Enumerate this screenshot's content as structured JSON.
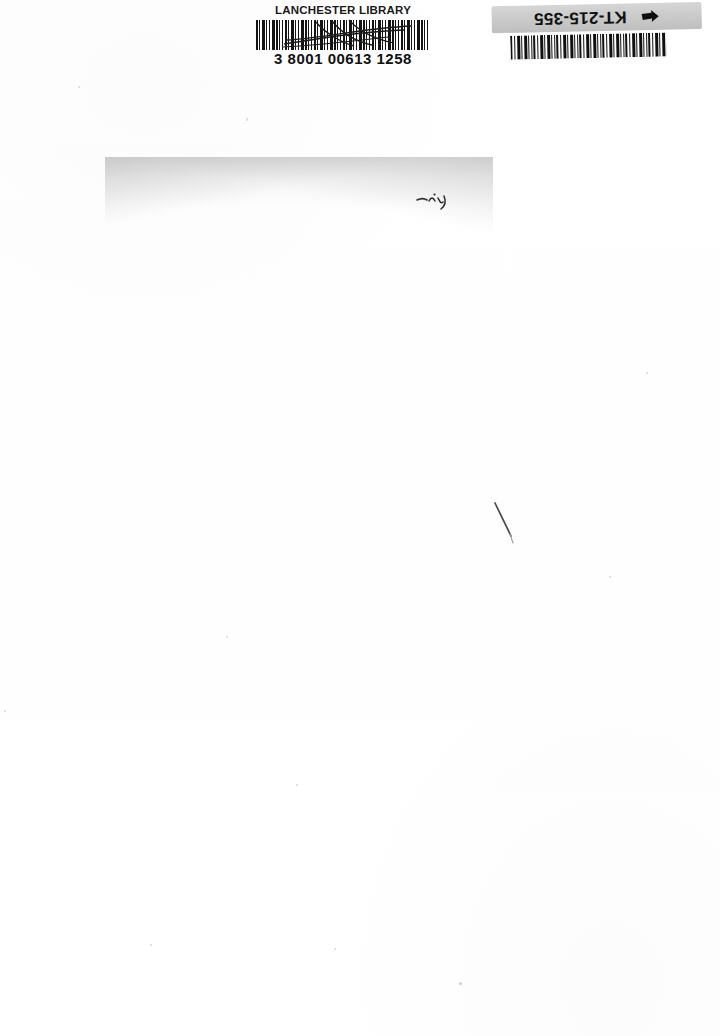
{
  "document": {
    "type": "scanned-page",
    "description": "Blank scanned cover page of a library book with two barcode labels at top",
    "background_color": "#ffffff",
    "page_width": 720,
    "page_height": 1036
  },
  "library_label": {
    "library_name": "LANCHESTER LIBRARY",
    "barcode_number": "3 8001 00613 1258",
    "barcode_icon": "barcode-icon",
    "ink_color": "#141414",
    "annotation": "pen-scribble-over-barcode"
  },
  "shelf_label": {
    "shelfmark": "KT-215-355",
    "arrow_icon": "arrow-pointer-icon",
    "barcode_icon": "barcode-icon",
    "orientation": "upside-down",
    "strip_color": "#c9c9c9",
    "ink_color": "#111111"
  },
  "artifacts": {
    "scan_shadow_label": "grey scan shadow band",
    "ink_mark_label": "faint handwritten ink mark",
    "pen_stroke_label": "thin diagonal pen stroke",
    "speck_label": "dust speck"
  }
}
